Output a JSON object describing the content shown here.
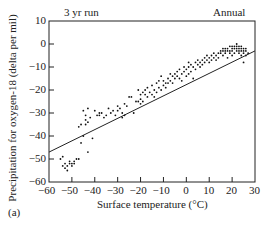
{
  "chart_data": {
    "type": "scatter",
    "title_left": "3 yr run",
    "title_right": "Annual",
    "panel_label": "(a)",
    "xlabel": "Surface temperature (°C)",
    "ylabel": "Precipitation for oxygen-18 (delta per mil)",
    "xlim": [
      -60,
      30
    ],
    "ylim": [
      -60,
      10
    ],
    "xticks": [
      -60,
      -50,
      -40,
      -30,
      -20,
      -10,
      0,
      10,
      20,
      30
    ],
    "yticks": [
      10,
      0,
      -10,
      -20,
      -30,
      -40,
      -50,
      -60
    ],
    "grid": false,
    "legend": "none",
    "regression_line": {
      "x": [
        -60,
        30
      ],
      "y": [
        -47,
        -3
      ]
    },
    "series": [
      {
        "name": "model annual means",
        "points": [
          [
            -55,
            -50
          ],
          [
            -54,
            -53
          ],
          [
            -54,
            -49
          ],
          [
            -53,
            -52
          ],
          [
            -53,
            -54
          ],
          [
            -52,
            -53
          ],
          [
            -52,
            -55
          ],
          [
            -51,
            -52
          ],
          [
            -51,
            -51
          ],
          [
            -50,
            -52
          ],
          [
            -50,
            -53
          ],
          [
            -49,
            -51
          ],
          [
            -49,
            -52
          ],
          [
            -48,
            -50
          ],
          [
            -47,
            -50
          ],
          [
            -47,
            -36
          ],
          [
            -46,
            -35
          ],
          [
            -46,
            -43
          ],
          [
            -45,
            -40
          ],
          [
            -45,
            -29
          ],
          [
            -44,
            -33
          ],
          [
            -44,
            -31
          ],
          [
            -44,
            -35
          ],
          [
            -43,
            -28
          ],
          [
            -43,
            -34
          ],
          [
            -43,
            -47
          ],
          [
            -42,
            -32
          ],
          [
            -41,
            -41
          ],
          [
            -40,
            -29
          ],
          [
            -39,
            -31
          ],
          [
            -38,
            -30
          ],
          [
            -38,
            -31
          ],
          [
            -37,
            -30
          ],
          [
            -36,
            -32
          ],
          [
            -35,
            -31
          ],
          [
            -34,
            -28
          ],
          [
            -33,
            -30
          ],
          [
            -32,
            -29
          ],
          [
            -31,
            -31
          ],
          [
            -30,
            -27
          ],
          [
            -30,
            -29
          ],
          [
            -29,
            -28
          ],
          [
            -28,
            -30
          ],
          [
            -28,
            -32
          ],
          [
            -27,
            -31
          ],
          [
            -27,
            -26
          ],
          [
            -26,
            -27
          ],
          [
            -25,
            -23
          ],
          [
            -24,
            -23
          ],
          [
            -23,
            -30
          ],
          [
            -22,
            -25
          ],
          [
            -21,
            -20
          ],
          [
            -21,
            -25
          ],
          [
            -20,
            -26
          ],
          [
            -20,
            -22
          ],
          [
            -20,
            -24
          ],
          [
            -19,
            -21
          ],
          [
            -19,
            -25
          ],
          [
            -18,
            -22
          ],
          [
            -18,
            -20
          ],
          [
            -17,
            -23
          ],
          [
            -17,
            -19
          ],
          [
            -16,
            -21
          ],
          [
            -15,
            -22
          ],
          [
            -15,
            -18
          ],
          [
            -14,
            -20
          ],
          [
            -14,
            -23
          ],
          [
            -13,
            -17
          ],
          [
            -13,
            -21
          ],
          [
            -12,
            -19
          ],
          [
            -12,
            -16
          ],
          [
            -11,
            -20
          ],
          [
            -11,
            -14
          ],
          [
            -10,
            -18
          ],
          [
            -10,
            -16
          ],
          [
            -9,
            -17
          ],
          [
            -9,
            -19
          ],
          [
            -8,
            -15
          ],
          [
            -8,
            -17
          ],
          [
            -7,
            -16
          ],
          [
            -7,
            -13
          ],
          [
            -6,
            -14
          ],
          [
            -6,
            -17
          ],
          [
            -5,
            -13
          ],
          [
            -5,
            -15
          ],
          [
            -4,
            -12
          ],
          [
            -4,
            -14
          ],
          [
            -3,
            -15
          ],
          [
            -3,
            -11
          ],
          [
            -2,
            -13
          ],
          [
            -2,
            -16
          ],
          [
            -1,
            -12
          ],
          [
            -1,
            -10
          ],
          [
            0,
            -11
          ],
          [
            0,
            -14
          ],
          [
            1,
            -10
          ],
          [
            1,
            -13
          ],
          [
            1,
            -8
          ],
          [
            2,
            -9
          ],
          [
            2,
            -12
          ],
          [
            3,
            -10
          ],
          [
            3,
            -15
          ],
          [
            4,
            -8
          ],
          [
            4,
            -11
          ],
          [
            5,
            -9
          ],
          [
            5,
            -7
          ],
          [
            6,
            -10
          ],
          [
            6,
            -8
          ],
          [
            7,
            -7
          ],
          [
            7,
            -9
          ],
          [
            8,
            -6
          ],
          [
            8,
            -8
          ],
          [
            9,
            -7
          ],
          [
            9,
            -5
          ],
          [
            10,
            -6
          ],
          [
            10,
            -8
          ],
          [
            11,
            -5
          ],
          [
            11,
            -7
          ],
          [
            12,
            -6
          ],
          [
            12,
            -4
          ],
          [
            13,
            -5
          ],
          [
            13,
            -7
          ],
          [
            14,
            -4
          ],
          [
            14,
            -6
          ],
          [
            15,
            -3
          ],
          [
            15,
            -4
          ],
          [
            16,
            -2
          ],
          [
            16,
            -3
          ],
          [
            16,
            -5
          ],
          [
            17,
            -3
          ],
          [
            17,
            -2
          ],
          [
            17,
            -4
          ],
          [
            18,
            -2
          ],
          [
            18,
            -3
          ],
          [
            18,
            -6
          ],
          [
            19,
            -1
          ],
          [
            19,
            -3
          ],
          [
            19,
            -4
          ],
          [
            20,
            -2
          ],
          [
            20,
            -1
          ],
          [
            20,
            -3
          ],
          [
            20,
            -5
          ],
          [
            21,
            -2
          ],
          [
            21,
            -1
          ],
          [
            21,
            -4
          ],
          [
            22,
            -1
          ],
          [
            22,
            -2
          ],
          [
            22,
            -3
          ],
          [
            22,
            0
          ],
          [
            23,
            -2
          ],
          [
            23,
            -1
          ],
          [
            23,
            -4
          ],
          [
            23,
            -3
          ],
          [
            24,
            -2
          ],
          [
            24,
            -1
          ],
          [
            24,
            -5
          ],
          [
            24,
            -3
          ],
          [
            25,
            -2
          ],
          [
            25,
            -4
          ],
          [
            25,
            -8
          ],
          [
            25,
            -3
          ],
          [
            26,
            -2
          ],
          [
            26,
            -5
          ],
          [
            26,
            -3
          ],
          [
            27,
            -4
          ]
        ]
      }
    ]
  }
}
